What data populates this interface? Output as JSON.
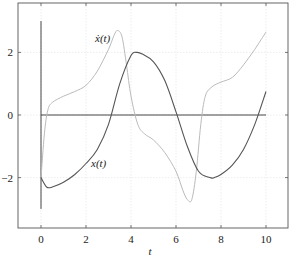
{
  "chart_data": {
    "type": "line",
    "title": "",
    "xlabel": "t",
    "ylabel": "",
    "xlim": [
      -1,
      11
    ],
    "ylim": [
      -3.6,
      3.6
    ],
    "xticks": [
      0,
      2,
      4,
      6,
      8,
      10
    ],
    "yticks": [
      -2,
      0,
      2
    ],
    "grid": true,
    "legend": "inline labels",
    "series": [
      {
        "name": "x(t)",
        "label": "x(t)",
        "color": "#555555",
        "x": [
          0,
          0.25,
          0.5,
          1.0,
          1.5,
          2.0,
          2.5,
          3.0,
          3.5,
          4.0,
          4.25,
          4.5,
          5.0,
          5.5,
          6.0,
          6.5,
          7.0,
          7.5,
          7.7,
          8.0,
          8.5,
          9.0,
          9.5,
          10.0
        ],
        "values": [
          -2.0,
          -2.3,
          -2.3,
          -2.15,
          -1.9,
          -1.55,
          -1.1,
          -0.3,
          1.0,
          1.9,
          2.0,
          1.95,
          1.7,
          1.1,
          0.1,
          -1.0,
          -1.8,
          -2.0,
          -2.0,
          -1.9,
          -1.6,
          -1.1,
          -0.3,
          0.75
        ]
      },
      {
        "name": "dx/dt",
        "label": "ẋ(t)",
        "color": "#bbbbbb",
        "x": [
          0,
          0.15,
          0.3,
          0.5,
          1.0,
          1.5,
          2.0,
          2.5,
          3.0,
          3.25,
          3.4,
          3.6,
          3.8,
          4.0,
          4.3,
          4.6,
          5.0,
          5.5,
          6.0,
          6.3,
          6.5,
          6.7,
          6.9,
          7.1,
          7.3,
          7.6,
          8.0,
          8.5,
          9.0,
          9.5,
          10.0
        ],
        "values": [
          -2.0,
          -0.6,
          0.15,
          0.4,
          0.6,
          0.75,
          0.95,
          1.4,
          2.1,
          2.55,
          2.7,
          2.5,
          1.6,
          0.6,
          -0.3,
          -0.6,
          -0.8,
          -1.2,
          -1.8,
          -2.4,
          -2.7,
          -2.7,
          -1.8,
          -0.3,
          0.6,
          0.9,
          1.05,
          1.2,
          1.6,
          2.1,
          2.65
        ]
      }
    ],
    "annotations": [
      {
        "text": "ẋ(t)",
        "x": 2.4,
        "y": 2.5
      },
      {
        "text": "x(t)",
        "x": 2.3,
        "y": -1.5
      }
    ],
    "reference_lines": [
      {
        "type": "horizontal",
        "y": 0,
        "from_x": 0,
        "to_x": 10
      },
      {
        "type": "vertical",
        "x": 0,
        "from_y": -3,
        "to_y": 3
      }
    ]
  },
  "labels": {
    "xlabel": "t",
    "xdot": "ẋ(t)",
    "x": "x(t)",
    "xticks": [
      "0",
      "2",
      "4",
      "6",
      "8",
      "10"
    ],
    "yticks": [
      "2",
      "0",
      "−2"
    ]
  }
}
